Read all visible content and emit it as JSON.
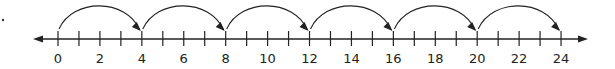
{
  "diagram": {
    "type": "number_line",
    "min": 0,
    "max": 24,
    "tick_step": 1,
    "label_step": 2,
    "labels": [
      "0",
      "2",
      "4",
      "6",
      "8",
      "10",
      "12",
      "14",
      "16",
      "18",
      "20",
      "22",
      "24"
    ],
    "jumps": [
      {
        "from": 0,
        "to": 4
      },
      {
        "from": 4,
        "to": 8
      },
      {
        "from": 8,
        "to": 12
      },
      {
        "from": 12,
        "to": 16
      },
      {
        "from": 16,
        "to": 20
      },
      {
        "from": 20,
        "to": 24
      }
    ],
    "jump_size": 4,
    "arrows_both_ends": true,
    "colors": {
      "line": "#222222",
      "background": "#ffffff"
    }
  },
  "layout": {
    "x0": 58,
    "unit_px": 20.96,
    "axis_y": 39,
    "left_arrow_tip": 33,
    "right_arrow_tip": 588
  }
}
